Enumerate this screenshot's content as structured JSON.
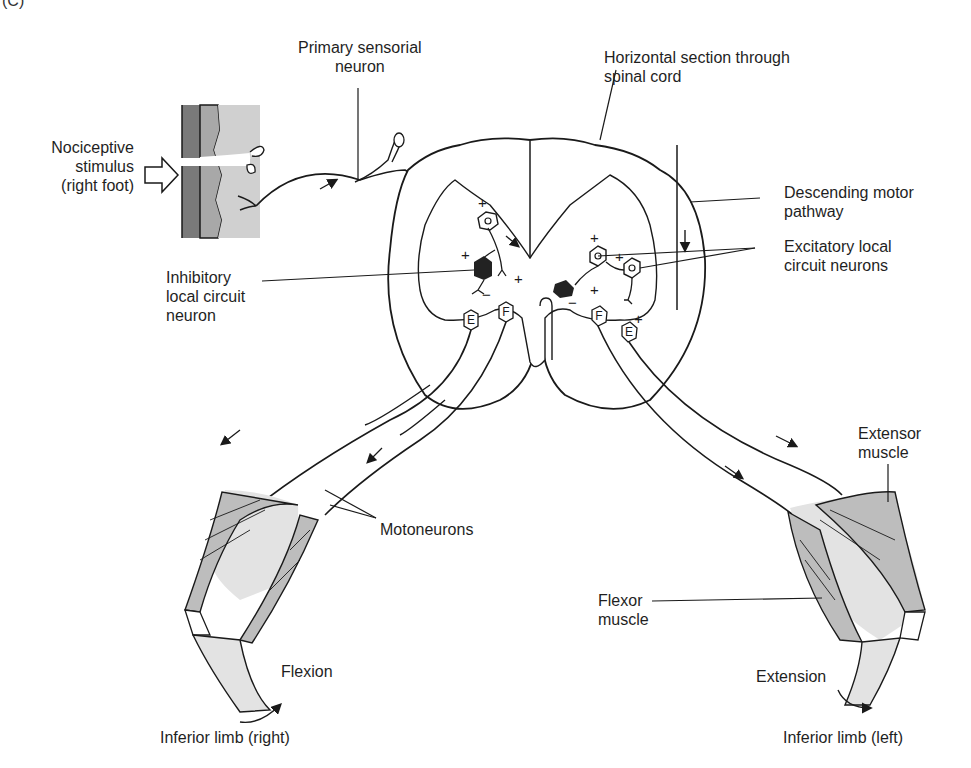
{
  "panel_label": "(C)",
  "labels": {
    "primary_neuron": [
      "Primary sensorial",
      "neuron"
    ],
    "spinal_section": [
      "Horizontal section through",
      "spinal cord"
    ],
    "stimulus": [
      "Nociceptive",
      "stimulus",
      "(right foot)"
    ],
    "descending": [
      "Descending motor",
      "pathway"
    ],
    "excitatory": [
      "Excitatory local",
      "circuit neurons"
    ],
    "inhibitory": [
      "Inhibitory",
      "local circuit",
      "neuron"
    ],
    "motoneurons": "Motoneurons",
    "extensor": [
      "Extensor",
      "muscle"
    ],
    "flexor": [
      "Flexor",
      "muscle"
    ],
    "flexion": "Flexion",
    "extension": "Extension",
    "limb_right": "Inferior limb (right)",
    "limb_left": "Inferior limb (left)"
  },
  "neuron_marks": {
    "extensor_motoneuron": "E",
    "flexor_motoneuron": "F",
    "excitatory_sign": "+",
    "inhibitory_sign": "−"
  },
  "colors": {
    "line": "#1a1a1a",
    "muscle_fill": "#bdbdbd",
    "bone_fill": "#e3e3e3",
    "skin_dark": "#7a7a7a",
    "skin_mid": "#a8a8a8",
    "skin_light": "#d0d0d0",
    "inhibitory_fill": "#222222"
  }
}
